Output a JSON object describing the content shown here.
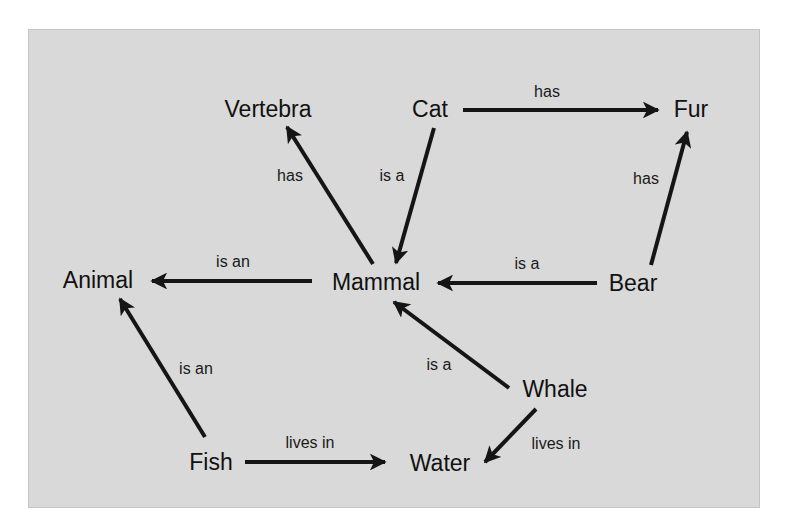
{
  "diagram": {
    "type": "semantic-network",
    "colors": {
      "background": "#d9d9d9",
      "ink": "#151515"
    },
    "nodes": [
      {
        "id": "vertebra",
        "label": "Vertebra"
      },
      {
        "id": "cat",
        "label": "Cat"
      },
      {
        "id": "fur",
        "label": "Fur"
      },
      {
        "id": "animal",
        "label": "Animal"
      },
      {
        "id": "mammal",
        "label": "Mammal"
      },
      {
        "id": "bear",
        "label": "Bear"
      },
      {
        "id": "whale",
        "label": "Whale"
      },
      {
        "id": "fish",
        "label": "Fish"
      },
      {
        "id": "water",
        "label": "Water"
      }
    ],
    "edges": [
      {
        "from": "cat",
        "to": "fur",
        "label": "has"
      },
      {
        "from": "mammal",
        "to": "vertebra",
        "label": "has"
      },
      {
        "from": "cat",
        "to": "mammal",
        "label": "is a"
      },
      {
        "from": "bear",
        "to": "fur",
        "label": "has"
      },
      {
        "from": "mammal",
        "to": "animal",
        "label": "is an"
      },
      {
        "from": "bear",
        "to": "mammal",
        "label": "is a"
      },
      {
        "from": "whale",
        "to": "mammal",
        "label": "is a"
      },
      {
        "from": "fish",
        "to": "animal",
        "label": "is an"
      },
      {
        "from": "whale",
        "to": "water",
        "label": "lives in"
      },
      {
        "from": "fish",
        "to": "water",
        "label": "lives in"
      }
    ]
  }
}
